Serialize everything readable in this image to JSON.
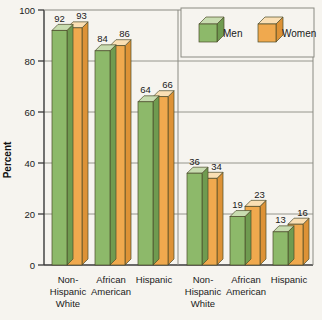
{
  "chart_data": {
    "type": "bar",
    "title": "",
    "xlabel": "",
    "ylabel": "Percent",
    "ylim": [
      0,
      100
    ],
    "yticks": [
      0,
      20,
      40,
      60,
      80,
      100
    ],
    "ytick_labels": [
      "0",
      "20",
      "40",
      "60",
      "80",
      "100"
    ],
    "grid": true,
    "legend_position": "top-right",
    "panels": [
      {
        "name": "left-panel",
        "categories": [
          "Non-Hispanic White",
          "African American",
          "Hispanic"
        ],
        "category_lines": [
          [
            "Non-",
            "Hispanic",
            "White"
          ],
          [
            "African",
            "American"
          ],
          [
            "Hispanic"
          ]
        ],
        "series": [
          {
            "name": "Men",
            "values": [
              92,
              84,
              64
            ]
          },
          {
            "name": "Women",
            "values": [
              93,
              86,
              66
            ]
          }
        ]
      },
      {
        "name": "right-panel",
        "categories": [
          "Non-Hispanic White",
          "African American",
          "Hispanic"
        ],
        "category_lines": [
          [
            "Non-",
            "Hispanic",
            "White"
          ],
          [
            "African",
            "American"
          ],
          [
            "Hispanic"
          ]
        ],
        "series": [
          {
            "name": "Men",
            "values": [
              36,
              19,
              13
            ]
          },
          {
            "name": "Women",
            "values": [
              34,
              23,
              16
            ]
          }
        ]
      }
    ],
    "legend": [
      {
        "label": "Men",
        "color": "#8db96a",
        "icon": "cube-icon-green"
      },
      {
        "label": "Women",
        "color": "#f0a94e",
        "icon": "cube-icon-orange"
      }
    ],
    "colors": {
      "men_front": "#8db96a",
      "men_top": "#c8dcb0",
      "men_side": "#6f9b50",
      "women_front": "#f0a94e",
      "women_top": "#fadfb4",
      "women_side": "#dd9236",
      "outline": "#4a4a2a",
      "grid": "#8a8a82",
      "axis": "#3a3a3a",
      "background": "#f6f4ef"
    }
  }
}
